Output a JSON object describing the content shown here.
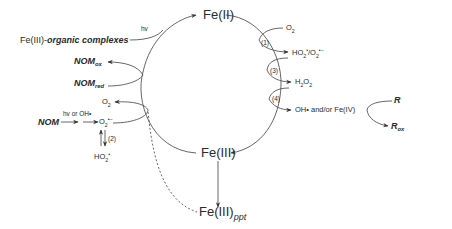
{
  "diagram": {
    "nodes": {
      "fe2": "Fe(II)",
      "fe3": "Fe(III)",
      "fe3_ppt_base": "Fe(III)",
      "fe3_ppt_sub": "ppt",
      "fe3_organic_prefix": "Fe(III)-",
      "fe3_organic_suffix": "organic complexes",
      "nom_ox_base": "NOM",
      "nom_ox_sub": "ox",
      "nom_red_base": "NOM",
      "nom_red_sub": "red",
      "nom": "NOM",
      "o2_left": "O",
      "o2_left_sub": "2",
      "superoxide_base": "O",
      "superoxide_sub": "2",
      "superoxide_sup": "•−",
      "ho2_left_base": "HO",
      "ho2_left_sub": "2",
      "ho2_left_sup": "•",
      "o2_right": "O",
      "o2_right_sub": "2",
      "ho2_o2_right_a": "HO",
      "ho2_o2_right_a_sub": "2",
      "ho2_o2_right_a_sup": "•",
      "ho2_o2_right_b": "/O",
      "ho2_o2_right_b_sub": "2",
      "ho2_o2_right_b_sup": "•−",
      "h2o2_a": "H",
      "h2o2_a_sub": "2",
      "h2o2_b": "O",
      "h2o2_b_sub": "2",
      "oh_fe4": "OH• and/or Fe(IV)",
      "r": "R",
      "r_ox_base": "R",
      "r_ox_sub": "ox"
    },
    "annotations": {
      "hv_top": "hv",
      "hv_or_oh": "hv or OH•",
      "step1": "(1)",
      "step2": "(2)",
      "step3": "(3)",
      "step4": "(4)"
    },
    "colors": {
      "line": "#555555",
      "text": "#2a2a2a",
      "background": "#ffffff"
    }
  }
}
